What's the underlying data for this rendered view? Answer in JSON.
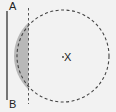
{
  "diagram": {
    "labels": {
      "point_a": "A",
      "point_b": "B",
      "center": "X"
    },
    "colors": {
      "background": "#f2f2f2",
      "stroke": "#333333",
      "shaded_region": "#b8b8b8"
    },
    "elements": {
      "segment_ab": {
        "x": 7,
        "y1": 12,
        "y2": 100,
        "style": "solid"
      },
      "dashed_line": {
        "x": 28.5,
        "y1": 8,
        "y2": 104,
        "style": "dashed"
      },
      "circle": {
        "cx": 63,
        "cy": 56,
        "r": 46,
        "style": "dashed"
      },
      "shaded_segment": {
        "description": "circular segment between dashed line and circle's left arc"
      }
    }
  }
}
